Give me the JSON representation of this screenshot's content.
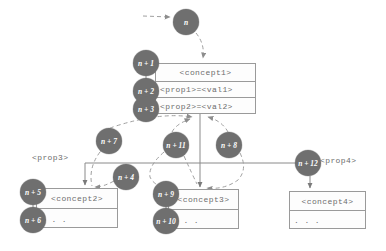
{
  "diagram": {
    "colors": {
      "node_fill": "#6f6f6f",
      "node_text": "#ffffff",
      "box_border": "#9a9a9a",
      "box_fill": "#fdfdfd",
      "text": "#6e6e6e",
      "edge_solid": "#8a8a8a",
      "edge_dashed": "#a0a0a0",
      "background": "#ffffff"
    },
    "nodes": [
      {
        "id": "n",
        "label": "n",
        "cx": 186,
        "cy": 22,
        "r": 13
      },
      {
        "id": "n1",
        "label": "n + 1",
        "cx": 146,
        "cy": 63,
        "r": 13
      },
      {
        "id": "n2",
        "label": "n + 2",
        "cx": 146,
        "cy": 91,
        "r": 13
      },
      {
        "id": "n3",
        "label": "n + 3",
        "cx": 146,
        "cy": 109,
        "r": 13
      },
      {
        "id": "n7",
        "label": "n + 7",
        "cx": 109,
        "cy": 141,
        "r": 13
      },
      {
        "id": "n11",
        "label": "n + 11",
        "cx": 176,
        "cy": 145,
        "r": 13
      },
      {
        "id": "n8",
        "label": "n + 8",
        "cx": 229,
        "cy": 145,
        "r": 13
      },
      {
        "id": "n4",
        "label": "n + 4",
        "cx": 126,
        "cy": 177,
        "r": 13
      },
      {
        "id": "n12",
        "label": "n + 12",
        "cx": 308,
        "cy": 163,
        "r": 13
      },
      {
        "id": "n5",
        "label": "n + 5",
        "cx": 33,
        "cy": 192,
        "r": 13
      },
      {
        "id": "n6",
        "label": "n + 6",
        "cx": 33,
        "cy": 220,
        "r": 13
      },
      {
        "id": "n9",
        "label": "n + 9",
        "cx": 166,
        "cy": 194,
        "r": 13
      },
      {
        "id": "n10",
        "label": "n + 10",
        "cx": 166,
        "cy": 221,
        "r": 13
      }
    ],
    "boxes": [
      {
        "id": "concept1",
        "header": "<concept1>",
        "rows": [
          "<prop1>=<val1>",
          "<prop2>=<val2>"
        ],
        "x": 155,
        "y": 63,
        "w": 101,
        "h": 51,
        "head_h": 18,
        "row_h": 16
      },
      {
        "id": "concept2",
        "header": "<concept2>",
        "rows": [
          ". . ."
        ],
        "x": 36,
        "y": 188,
        "w": 82,
        "h": 40,
        "head_h": 20,
        "row_h": 20
      },
      {
        "id": "concept3",
        "header": "<concept3>",
        "rows": [
          ". . ."
        ],
        "x": 168,
        "y": 189,
        "w": 71,
        "h": 40,
        "head_h": 20,
        "row_h": 20
      },
      {
        "id": "concept4",
        "header": "<concept4>",
        "rows": [
          ". . ."
        ],
        "x": 289,
        "y": 191,
        "w": 77,
        "h": 38,
        "head_h": 19,
        "row_h": 19
      }
    ],
    "labels": [
      {
        "id": "prop3",
        "text": "<prop3>",
        "x": 32,
        "y": 153
      },
      {
        "id": "prop4",
        "text": "<prop4>",
        "x": 320,
        "y": 156
      }
    ]
  }
}
